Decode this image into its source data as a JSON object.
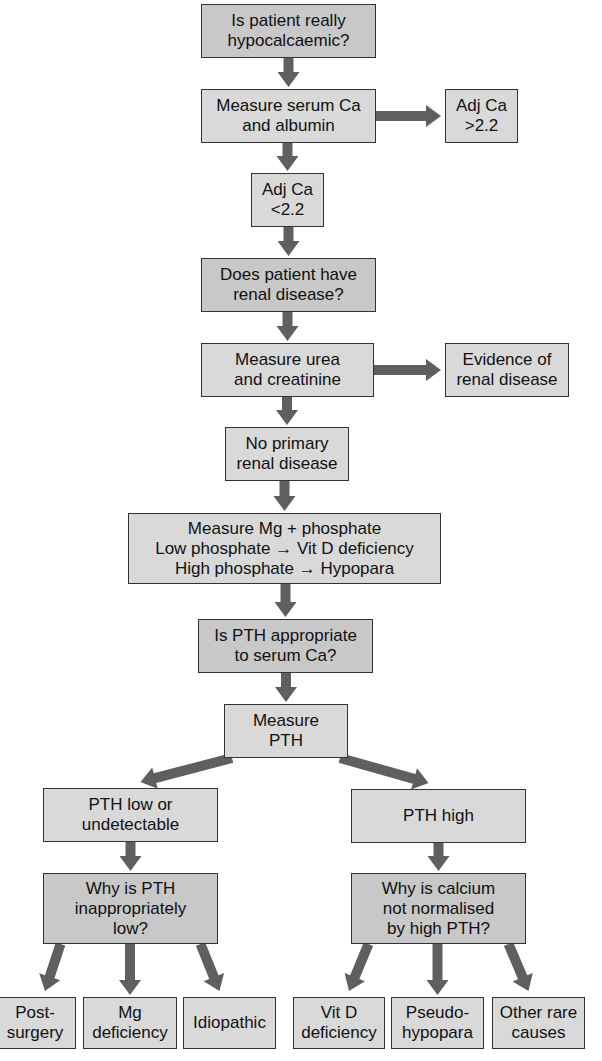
{
  "diagram": {
    "type": "flowchart",
    "topic": "Investigation of hypocalcaemia",
    "colors": {
      "box_fill": "#d9d9d9",
      "question_fill": "#c8c8c8",
      "border": "#333333",
      "arrow": "#5f5f5f"
    },
    "nodes": {
      "q_hypocalcaemic": [
        "Is patient really",
        "hypocalcaemic?"
      ],
      "measure_ca": [
        "Measure serum Ca",
        "and albumin"
      ],
      "adj_ca_high": [
        "Adj Ca",
        ">2.2"
      ],
      "adj_ca_low": [
        "Adj Ca",
        "<2.2"
      ],
      "q_renal": [
        "Does patient have",
        "renal disease?"
      ],
      "measure_urea": [
        "Measure urea",
        "and creatinine"
      ],
      "renal_evidence": [
        "Evidence of",
        "renal disease"
      ],
      "no_renal": [
        "No primary",
        "renal disease"
      ],
      "measure_mg": [
        "Measure Mg + phosphate",
        "Low phosphate → Vit D deficiency",
        "High phosphate  → Hypopara"
      ],
      "q_pth": [
        "Is PTH appropriate",
        "to serum Ca?"
      ],
      "measure_pth": [
        "Measure",
        "PTH"
      ],
      "pth_low": [
        "PTH low or",
        "undetectable"
      ],
      "pth_high": [
        "PTH high"
      ],
      "q_pth_low": [
        "Why is PTH",
        "inappropriately",
        "low?"
      ],
      "q_ca_not_normal": [
        "Why is calcium",
        "not normalised",
        "by high PTH?"
      ],
      "post_surgery": [
        "Post-",
        "surgery"
      ],
      "mg_deficiency": [
        "Mg",
        "deficiency"
      ],
      "idiopathic": [
        "Idiopathic"
      ],
      "vitd_deficiency": [
        "Vit D",
        "deficiency"
      ],
      "pseudo_hypopara": [
        "Pseudo-",
        "hypopara"
      ],
      "other_rare": [
        "Other rare",
        "causes"
      ]
    },
    "edges": [
      [
        "q_hypocalcaemic",
        "measure_ca"
      ],
      [
        "measure_ca",
        "adj_ca_high"
      ],
      [
        "measure_ca",
        "adj_ca_low"
      ],
      [
        "adj_ca_low",
        "q_renal"
      ],
      [
        "q_renal",
        "measure_urea"
      ],
      [
        "measure_urea",
        "renal_evidence"
      ],
      [
        "measure_urea",
        "no_renal"
      ],
      [
        "no_renal",
        "measure_mg"
      ],
      [
        "measure_mg",
        "q_pth"
      ],
      [
        "q_pth",
        "measure_pth"
      ],
      [
        "measure_pth",
        "pth_low"
      ],
      [
        "measure_pth",
        "pth_high"
      ],
      [
        "pth_low",
        "q_pth_low"
      ],
      [
        "pth_high",
        "q_ca_not_normal"
      ],
      [
        "q_pth_low",
        "post_surgery"
      ],
      [
        "q_pth_low",
        "mg_deficiency"
      ],
      [
        "q_pth_low",
        "idiopathic"
      ],
      [
        "q_ca_not_normal",
        "vitd_deficiency"
      ],
      [
        "q_ca_not_normal",
        "pseudo_hypopara"
      ],
      [
        "q_ca_not_normal",
        "other_rare"
      ]
    ]
  }
}
